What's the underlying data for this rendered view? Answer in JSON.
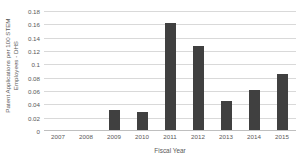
{
  "chart_data": {
    "type": "bar",
    "title": "",
    "xlabel": "Fiscal Year",
    "ylabel": "Patent Applications per 100 STEM Employees - DHS",
    "ylabel_lines": [
      "Patent Applications per 100 STEM",
      "Employees - DHS"
    ],
    "categories": [
      "2007",
      "2008",
      "2009",
      "2010",
      "2011",
      "2012",
      "2013",
      "2014",
      "2015"
    ],
    "values": [
      0,
      0,
      0.031,
      0.028,
      0.162,
      0.128,
      0.045,
      0.062,
      0.085
    ],
    "ylim": [
      0,
      0.18
    ],
    "ytick_labels": [
      "0.18",
      "0.16",
      "0.14",
      "0.12",
      "0.1",
      "0.08",
      "0.06",
      "0.04",
      "0.02",
      "0"
    ],
    "ytick_values": [
      0.18,
      0.16,
      0.14,
      0.12,
      0.1,
      0.08,
      0.06,
      0.04,
      0.02,
      0
    ],
    "grid": true,
    "legend": "none",
    "bar_color": "#404040",
    "gridline_color": "#D9D9D9",
    "text_color": "#595959",
    "background": "#FFFFFF"
  }
}
